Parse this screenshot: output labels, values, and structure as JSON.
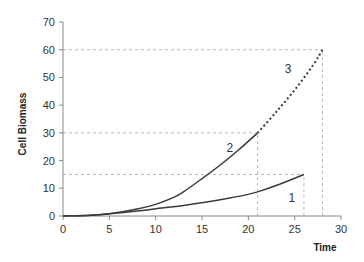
{
  "chart_data": {
    "type": "line",
    "title": "",
    "xlabel": "Time",
    "ylabel": "Cell Biomass",
    "xlim": [
      0,
      30
    ],
    "ylim": [
      0,
      70
    ],
    "xticks": [
      0,
      5,
      10,
      15,
      20,
      25,
      30
    ],
    "yticks": [
      0,
      10,
      20,
      30,
      40,
      50,
      60,
      70
    ],
    "grid": false,
    "legend": "none (curves labeled inline)",
    "series": [
      {
        "name": "1",
        "style": "solid",
        "x": [
          0,
          3,
          5,
          8,
          10,
          13,
          15,
          18,
          20,
          21,
          23,
          26
        ],
        "y": [
          0,
          0.3,
          0.8,
          1.8,
          2.6,
          3.8,
          4.8,
          6.5,
          7.8,
          8.7,
          11,
          15
        ]
      },
      {
        "name": "2",
        "style": "solid",
        "x": [
          0,
          3,
          5,
          8,
          10,
          12,
          13,
          15,
          17,
          19,
          21
        ],
        "y": [
          0,
          0.3,
          0.8,
          2.5,
          4.2,
          6.8,
          8.7,
          13.5,
          18.5,
          24,
          30
        ]
      },
      {
        "name": "3",
        "style": "dotted",
        "x": [
          21,
          23,
          25,
          27,
          28
        ],
        "y": [
          30,
          37.5,
          45.5,
          54.5,
          60
        ]
      }
    ],
    "annotations": [
      {
        "text": "1",
        "x": 24.7,
        "y": 5
      },
      {
        "text": "2",
        "x": 18,
        "y": 23
      },
      {
        "text": "3",
        "x": 24.3,
        "y": 51.5
      }
    ],
    "reference_lines": [
      {
        "type": "horizontal",
        "y": 15,
        "x_to": 26
      },
      {
        "type": "horizontal",
        "y": 30,
        "x_to": 21
      },
      {
        "type": "horizontal",
        "y": 60,
        "x_to": 28
      },
      {
        "type": "vertical",
        "x": 21,
        "y_to": 30
      },
      {
        "type": "vertical",
        "x": 26,
        "y_to": 15
      },
      {
        "type": "vertical",
        "x": 28,
        "y_to": 60
      }
    ]
  },
  "colors": {
    "curve": "#3a3a3a",
    "reference": "#b8b8b8",
    "axis": "#888888"
  }
}
